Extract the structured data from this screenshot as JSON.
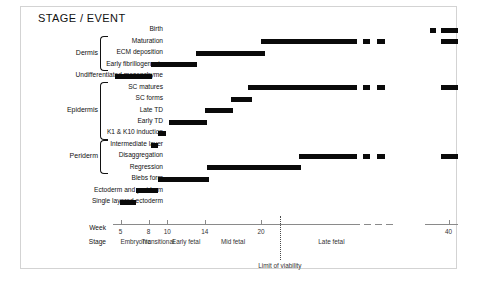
{
  "figure": {
    "title": "STAGE / EVENT"
  },
  "axis": {
    "week_label": "Week",
    "stage_label": "Stage",
    "ticks": [
      {
        "week": 5,
        "label": "5"
      },
      {
        "week": 8,
        "label": "8"
      },
      {
        "week": 10,
        "label": "10"
      },
      {
        "week": 14,
        "label": "14"
      },
      {
        "week": 20,
        "label": "20"
      },
      {
        "week": 40,
        "label": "40"
      }
    ],
    "stages": [
      {
        "label": "Embryonic",
        "center_week": 6.6
      },
      {
        "label": "Transitional",
        "center_week": 9.0
      },
      {
        "label": "Early fetal",
        "center_week": 12.0
      },
      {
        "label": "Mid fetal",
        "center_week": 17.0
      },
      {
        "label": "Late fetal",
        "center_week": 27.5
      }
    ],
    "viability": {
      "label": "Limit of viability",
      "week": 22.0
    },
    "break_gap": {
      "from_week": 30.5,
      "to_week": 37.5
    }
  },
  "groups": [
    {
      "name": "Dermis",
      "first_row": 1,
      "last_row": 3
    },
    {
      "name": "Epidermis",
      "first_row": 5,
      "last_row": 9
    },
    {
      "name": "Periderm",
      "first_row": 10,
      "last_row": 12
    }
  ],
  "chart_data": {
    "type": "bar",
    "title": "STAGE / EVENT",
    "xlabel": "Week",
    "ylabel": "",
    "xlim": [
      4.2,
      41
    ],
    "grid": false,
    "orientation": "horizontal-gantt",
    "categories": [
      "Birth",
      "Maturation",
      "ECM deposition",
      "Early fibrillogenesis",
      "Undifferentiated mesenchyme",
      "SC matures",
      "SC forms",
      "Late TD",
      "Early TD",
      "K1 & K10 induction",
      "Intermediate layer",
      "Disaggregation",
      "Regression",
      "Blebs form",
      "Ectoderm and periderm",
      "Single layered ectoderm"
    ],
    "bars": [
      {
        "event": "Birth",
        "segments": [
          [
            38.0,
            38.6
          ],
          [
            39.2,
            41.0
          ]
        ]
      },
      {
        "event": "Maturation",
        "segments": [
          [
            20.0,
            30.2
          ],
          [
            30.9,
            31.6
          ],
          [
            32.4,
            33.2
          ],
          [
            39.2,
            41.0
          ]
        ]
      },
      {
        "event": "ECM deposition",
        "segments": [
          [
            13.0,
            20.4
          ]
        ]
      },
      {
        "event": "Early fibrillogenesis",
        "segments": [
          [
            8.2,
            13.2
          ]
        ]
      },
      {
        "event": "Undifferentiated mesenchyme",
        "segments": [
          [
            4.4,
            8.4
          ]
        ]
      },
      {
        "event": "SC matures",
        "segments": [
          [
            18.6,
            30.2
          ],
          [
            30.9,
            31.6
          ],
          [
            32.4,
            33.2
          ],
          [
            39.2,
            41.0
          ]
        ]
      },
      {
        "event": "SC forms",
        "segments": [
          [
            16.8,
            19.0
          ]
        ]
      },
      {
        "event": "Late TD",
        "segments": [
          [
            14.0,
            17.0
          ]
        ]
      },
      {
        "event": "Early TD",
        "segments": [
          [
            10.2,
            14.2
          ]
        ]
      },
      {
        "event": "K1 & K10 induction",
        "segments": [
          [
            9.0,
            9.8
          ]
        ]
      },
      {
        "event": "Intermediate layer",
        "segments": [
          [
            8.2,
            9.0
          ]
        ]
      },
      {
        "event": "Disaggregation",
        "segments": [
          [
            24.0,
            30.2
          ],
          [
            30.9,
            31.6
          ],
          [
            32.4,
            33.2
          ],
          [
            39.2,
            41.0
          ]
        ]
      },
      {
        "event": "Regression",
        "segments": [
          [
            14.2,
            24.2
          ]
        ]
      },
      {
        "event": "Blebs form",
        "segments": [
          [
            9.0,
            14.4
          ]
        ]
      },
      {
        "event": "Ectoderm and periderm",
        "segments": [
          [
            6.6,
            9.0
          ]
        ]
      },
      {
        "event": "Single layered ectoderm",
        "segments": [
          [
            4.9,
            6.6
          ]
        ]
      }
    ]
  }
}
